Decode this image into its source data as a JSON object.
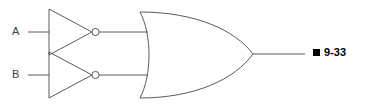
{
  "diagram": {
    "type": "logic-circuit",
    "background_color": "#ffffff",
    "line_color": "#5a5a5a",
    "inputs": [
      {
        "id": "a",
        "label": "A"
      },
      {
        "id": "b",
        "label": "B"
      }
    ],
    "gates": [
      {
        "id": "inverter-top",
        "type": "NOT",
        "input": "A"
      },
      {
        "id": "inverter-bottom",
        "type": "NOT",
        "input": "B"
      },
      {
        "id": "or-gate",
        "type": "OR",
        "inputs": [
          "NOT A",
          "NOT B"
        ]
      }
    ],
    "figure": {
      "bullet": "filled-square",
      "number": "9-33",
      "color": "#000000"
    }
  }
}
